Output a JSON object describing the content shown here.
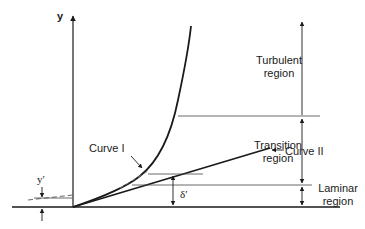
{
  "diagram": {
    "type": "velocity-profile-regions",
    "axis": {
      "y_label": "y"
    },
    "curves": [
      {
        "id": "curve-1",
        "label": "Curve I"
      },
      {
        "id": "curve-2",
        "label": "Curve II"
      }
    ],
    "regions": [
      {
        "name": "turbulent",
        "line1": "Turbulent",
        "line2": "region"
      },
      {
        "name": "transition",
        "line1": "Transition",
        "line2": "region"
      },
      {
        "name": "laminar",
        "line1": "Laminar",
        "line2": "region"
      }
    ],
    "dimensions": {
      "y_prime": "y′",
      "delta_prime": "δ′"
    },
    "colors": {
      "ink": "#1a1a1a",
      "thin_line": "#444444",
      "background": "#ffffff"
    }
  }
}
